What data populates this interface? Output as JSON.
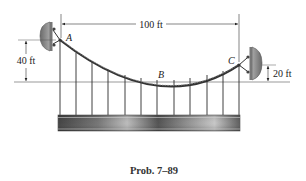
{
  "figure": {
    "caption": "Prob. 7–89",
    "points": {
      "A": "A",
      "B": "B",
      "C": "C"
    },
    "dimensions": {
      "span": "100 ft",
      "left_height": "40 ft",
      "right_height": "20 ft"
    },
    "components": {
      "cable": "parabolic suspension cable",
      "hangers_count": 12,
      "deck": "uniform deck beam",
      "supports": [
        "left wall anchor at A",
        "right wall anchor at C"
      ]
    },
    "colors": {
      "line": "#2a2a2a",
      "support_fill": "#8a8a8a",
      "deck_dark": "#3c3c3c",
      "deck_light": "#b5b5b5"
    }
  }
}
